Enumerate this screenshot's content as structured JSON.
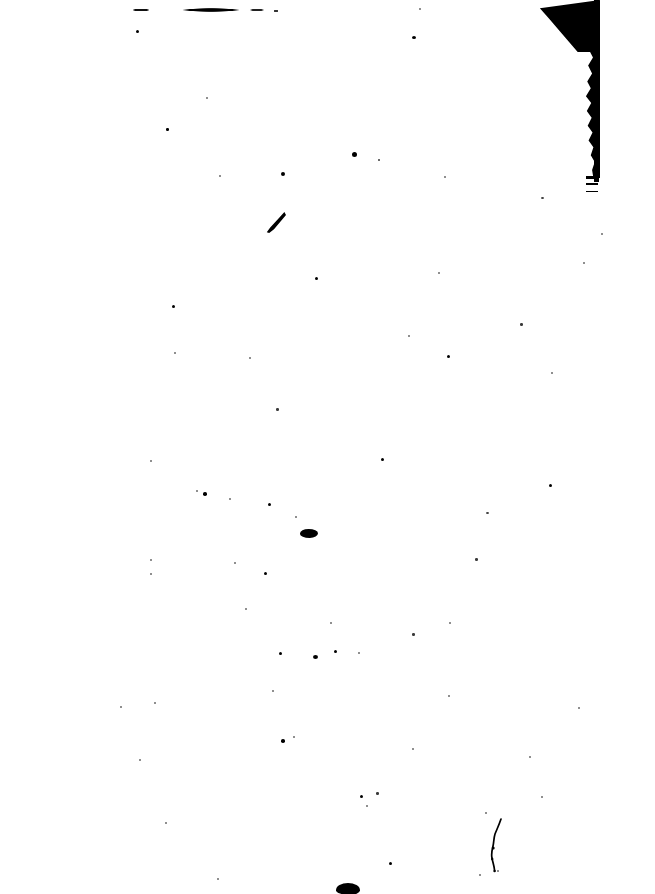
{
  "document": {
    "kind": "scanned-page",
    "title": "Scanned Document Page",
    "page_label": "",
    "body_text": "",
    "rendering": "bitonal black-and-white threshold scan",
    "condition": "blank page with scan noise",
    "background_color": "#ffffff",
    "ink_color": "#000000",
    "canvas": {
      "width": 655,
      "height": 894
    }
  },
  "artifacts": {
    "edge_shadow": {
      "name": "top-right scan edge shadow",
      "description": "Solid black wedge at the top-right corner tapering into a ragged vertical band down the right margin",
      "color": "#000000",
      "x": 538,
      "y": 0,
      "width": 62,
      "height": 198
    },
    "top_smudge": {
      "name": "faint horizontal smudge near top edge",
      "description": "Broken grey horizontal streak, likely a clipped line of text or a roller mark",
      "color": "#1a1a1a",
      "x": 133,
      "y": 6,
      "width": 150,
      "height": 8
    },
    "ink_comma": {
      "name": "comma-shaped ink mark",
      "color": "#000000",
      "x": 266,
      "y": 212,
      "width": 20,
      "height": 22
    },
    "ink_blob_center": {
      "name": "ink blob cluster near page centre",
      "color": "#000000",
      "x": 300,
      "y": 529,
      "width": 18,
      "height": 9
    },
    "ink_squiggle": {
      "name": "thin squiggly pen stroke in lower right",
      "color": "#000000",
      "x": 488,
      "y": 818,
      "width": 18,
      "height": 56
    },
    "ink_blob_bottom": {
      "name": "heavy ink blob at bottom edge",
      "color": "#000000",
      "x": 336,
      "y": 883,
      "width": 24,
      "height": 12
    }
  },
  "specks": [
    {
      "x": 136,
      "y": 30,
      "w": 3,
      "h": 3,
      "tone": "dark"
    },
    {
      "x": 206,
      "y": 97,
      "w": 2,
      "h": 2,
      "tone": "faint"
    },
    {
      "x": 412,
      "y": 36,
      "w": 4,
      "h": 3,
      "tone": "dark"
    },
    {
      "x": 419,
      "y": 8,
      "w": 2,
      "h": 2,
      "tone": "faint"
    },
    {
      "x": 352,
      "y": 152,
      "w": 5,
      "h": 5,
      "tone": "dark"
    },
    {
      "x": 378,
      "y": 159,
      "w": 2,
      "h": 2,
      "tone": "mid"
    },
    {
      "x": 281,
      "y": 172,
      "w": 4,
      "h": 4,
      "tone": "dark"
    },
    {
      "x": 166,
      "y": 128,
      "w": 2.5,
      "h": 2.5,
      "tone": "dark"
    },
    {
      "x": 219,
      "y": 175,
      "w": 2,
      "h": 2,
      "tone": "faint"
    },
    {
      "x": 444,
      "y": 176,
      "w": 2,
      "h": 2,
      "tone": "faint"
    },
    {
      "x": 541,
      "y": 197,
      "w": 3,
      "h": 2,
      "tone": "mid"
    },
    {
      "x": 315,
      "y": 277,
      "w": 3,
      "h": 3,
      "tone": "dark"
    },
    {
      "x": 438,
      "y": 272,
      "w": 2,
      "h": 2,
      "tone": "faint"
    },
    {
      "x": 520,
      "y": 323,
      "w": 2.5,
      "h": 2.5,
      "tone": "mid"
    },
    {
      "x": 172,
      "y": 305,
      "w": 3,
      "h": 3,
      "tone": "dark"
    },
    {
      "x": 276,
      "y": 408,
      "w": 2.5,
      "h": 2.5,
      "tone": "mid"
    },
    {
      "x": 408,
      "y": 335,
      "w": 2,
      "h": 2,
      "tone": "faint"
    },
    {
      "x": 447,
      "y": 355,
      "w": 3,
      "h": 3,
      "tone": "dark"
    },
    {
      "x": 551,
      "y": 372,
      "w": 2,
      "h": 2,
      "tone": "faint"
    },
    {
      "x": 601,
      "y": 233,
      "w": 2,
      "h": 2,
      "tone": "faint"
    },
    {
      "x": 174,
      "y": 352,
      "w": 2,
      "h": 2,
      "tone": "faint"
    },
    {
      "x": 249,
      "y": 357,
      "w": 2,
      "h": 2,
      "tone": "faint"
    },
    {
      "x": 381,
      "y": 458,
      "w": 3,
      "h": 3,
      "tone": "dark"
    },
    {
      "x": 150,
      "y": 460,
      "w": 2,
      "h": 2,
      "tone": "faint"
    },
    {
      "x": 549,
      "y": 484,
      "w": 3,
      "h": 3,
      "tone": "dark"
    },
    {
      "x": 203,
      "y": 492,
      "w": 3.5,
      "h": 3.5,
      "tone": "dark"
    },
    {
      "x": 196,
      "y": 490,
      "w": 2,
      "h": 2,
      "tone": "faint"
    },
    {
      "x": 229,
      "y": 498,
      "w": 2,
      "h": 2,
      "tone": "faint"
    },
    {
      "x": 268,
      "y": 503,
      "w": 3,
      "h": 3,
      "tone": "dark"
    },
    {
      "x": 295,
      "y": 516,
      "w": 2,
      "h": 2,
      "tone": "faint"
    },
    {
      "x": 486,
      "y": 512,
      "w": 3,
      "h": 2,
      "tone": "mid"
    },
    {
      "x": 475,
      "y": 558,
      "w": 2.5,
      "h": 2.5,
      "tone": "mid"
    },
    {
      "x": 150,
      "y": 559,
      "w": 2,
      "h": 2,
      "tone": "faint"
    },
    {
      "x": 234,
      "y": 562,
      "w": 2,
      "h": 2,
      "tone": "faint"
    },
    {
      "x": 150,
      "y": 573,
      "w": 2,
      "h": 2,
      "tone": "faint"
    },
    {
      "x": 264,
      "y": 572,
      "w": 3,
      "h": 3,
      "tone": "dark"
    },
    {
      "x": 412,
      "y": 633,
      "w": 2.5,
      "h": 2.5,
      "tone": "mid"
    },
    {
      "x": 330,
      "y": 622,
      "w": 2,
      "h": 2,
      "tone": "faint"
    },
    {
      "x": 279,
      "y": 652,
      "w": 3,
      "h": 3,
      "tone": "dark"
    },
    {
      "x": 313,
      "y": 655,
      "w": 5,
      "h": 4,
      "tone": "dark"
    },
    {
      "x": 334,
      "y": 650,
      "w": 3,
      "h": 3,
      "tone": "dark"
    },
    {
      "x": 358,
      "y": 652,
      "w": 2,
      "h": 2,
      "tone": "faint"
    },
    {
      "x": 272,
      "y": 690,
      "w": 2,
      "h": 2,
      "tone": "faint"
    },
    {
      "x": 154,
      "y": 702,
      "w": 2,
      "h": 2,
      "tone": "faint"
    },
    {
      "x": 120,
      "y": 706,
      "w": 2,
      "h": 2,
      "tone": "faint"
    },
    {
      "x": 448,
      "y": 695,
      "w": 2,
      "h": 2,
      "tone": "faint"
    },
    {
      "x": 578,
      "y": 707,
      "w": 2,
      "h": 2,
      "tone": "faint"
    },
    {
      "x": 139,
      "y": 759,
      "w": 2,
      "h": 2,
      "tone": "faint"
    },
    {
      "x": 281,
      "y": 739,
      "w": 3.5,
      "h": 3.5,
      "tone": "dark"
    },
    {
      "x": 293,
      "y": 736,
      "w": 2,
      "h": 2,
      "tone": "faint"
    },
    {
      "x": 412,
      "y": 748,
      "w": 2,
      "h": 2,
      "tone": "faint"
    },
    {
      "x": 529,
      "y": 756,
      "w": 2,
      "h": 2,
      "tone": "faint"
    },
    {
      "x": 541,
      "y": 796,
      "w": 2,
      "h": 2,
      "tone": "faint"
    },
    {
      "x": 376,
      "y": 792,
      "w": 2.5,
      "h": 2.5,
      "tone": "mid"
    },
    {
      "x": 360,
      "y": 795,
      "w": 3,
      "h": 3,
      "tone": "dark"
    },
    {
      "x": 366,
      "y": 805,
      "w": 2,
      "h": 2,
      "tone": "faint"
    },
    {
      "x": 165,
      "y": 822,
      "w": 2,
      "h": 2,
      "tone": "faint"
    },
    {
      "x": 485,
      "y": 812,
      "w": 2,
      "h": 2,
      "tone": "faint"
    },
    {
      "x": 217,
      "y": 878,
      "w": 2,
      "h": 2,
      "tone": "faint"
    },
    {
      "x": 389,
      "y": 862,
      "w": 3,
      "h": 3,
      "tone": "dark"
    },
    {
      "x": 479,
      "y": 874,
      "w": 2,
      "h": 2,
      "tone": "faint"
    },
    {
      "x": 497,
      "y": 870,
      "w": 2,
      "h": 2,
      "tone": "faint"
    },
    {
      "x": 245,
      "y": 608,
      "w": 2,
      "h": 2,
      "tone": "faint"
    },
    {
      "x": 449,
      "y": 622,
      "w": 2,
      "h": 2,
      "tone": "faint"
    },
    {
      "x": 583,
      "y": 262,
      "w": 2,
      "h": 2,
      "tone": "faint"
    }
  ]
}
